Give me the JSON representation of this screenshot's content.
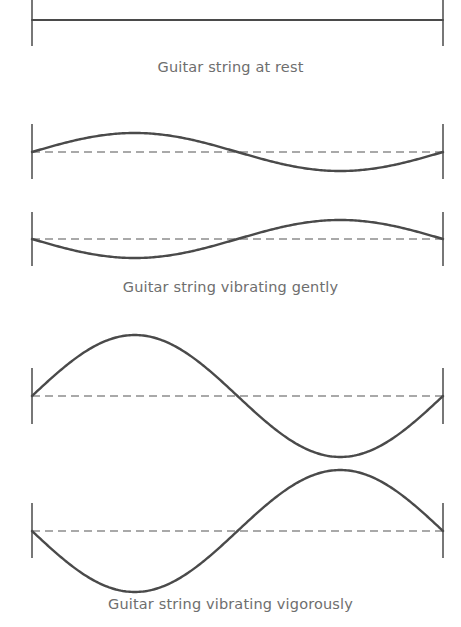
{
  "figure": {
    "background_color": "#ffffff",
    "stroke_color": "#4a4a4a",
    "dash_color": "#555555",
    "endbar_color": "#555555",
    "caption_color": "#6e6e6e",
    "width": 461,
    "height": 627
  },
  "captions": {
    "rest": "Guitar string at rest",
    "gently": "Guitar string vibrating gently",
    "vigorously": "Guitar string vibrating vigorously"
  },
  "chart_data": {
    "type": "line",
    "xlabel": "",
    "ylabel": "",
    "grid": false,
    "legend_position": "none",
    "x_range": [
      0,
      1
    ],
    "note": "Each panel shows a string fixed at both ends (vertical end bars) with a dashed rest-axis; the solid curve is one full sine period y = A*sin(2*pi*x) or its inverse.",
    "panels": [
      {
        "id": "panel-rest",
        "caption": "Guitar string at rest",
        "x_left": 32,
        "x_right": 443,
        "axis_y": 20,
        "endbar_top": 0,
        "endbar_bottom": 46,
        "amplitude": 0,
        "phase": "flat",
        "axis_style": "solid",
        "cycles": 0
      },
      {
        "id": "panel-gentle-a",
        "caption": "Guitar string vibrating gently",
        "x_left": 32,
        "x_right": 443,
        "axis_y": 152,
        "endbar_top": 124,
        "endbar_bottom": 179,
        "amplitude": 19,
        "phase": "crest-first",
        "axis_style": "dashed",
        "cycles": 1
      },
      {
        "id": "panel-gentle-b",
        "caption": "Guitar string vibrating gently",
        "x_left": 32,
        "x_right": 443,
        "axis_y": 239,
        "endbar_top": 212,
        "endbar_bottom": 266,
        "amplitude": 19,
        "phase": "trough-first",
        "axis_style": "dashed",
        "cycles": 1
      },
      {
        "id": "panel-vigorous-a",
        "caption": "Guitar string vibrating vigorously",
        "x_left": 32,
        "x_right": 443,
        "axis_y": 396,
        "endbar_top": 368,
        "endbar_bottom": 424,
        "amplitude": 61,
        "phase": "crest-first",
        "axis_style": "dashed",
        "cycles": 1
      },
      {
        "id": "panel-vigorous-b",
        "caption": "Guitar string vibrating vigorously",
        "x_left": 32,
        "x_right": 443,
        "axis_y": 531,
        "endbar_top": 503,
        "endbar_bottom": 558,
        "amplitude": 61,
        "phase": "trough-first",
        "axis_style": "dashed",
        "cycles": 1
      }
    ],
    "series": [
      {
        "name": "string at rest",
        "amplitude": 0,
        "phase": "flat"
      },
      {
        "name": "gentle vibration, upward phase",
        "amplitude": 19,
        "phase": "crest-first"
      },
      {
        "name": "gentle vibration, downward phase",
        "amplitude": 19,
        "phase": "trough-first"
      },
      {
        "name": "vigorous vibration, upward phase",
        "amplitude": 61,
        "phase": "crest-first"
      },
      {
        "name": "vigorous vibration, downward phase",
        "amplitude": 61,
        "phase": "trough-first"
      }
    ]
  }
}
